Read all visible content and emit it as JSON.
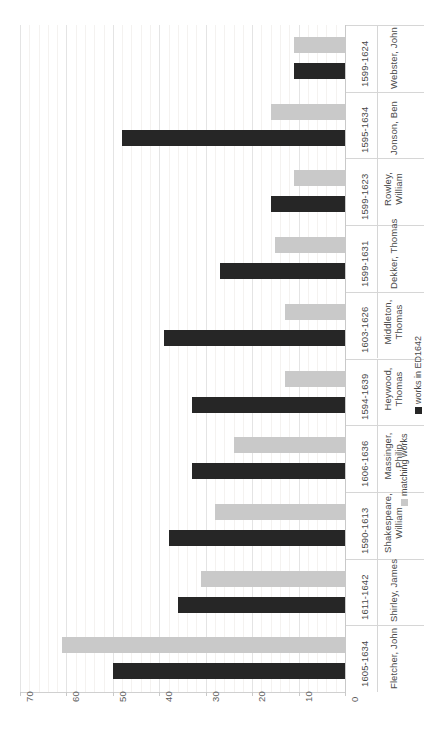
{
  "chart_data": {
    "type": "bar",
    "orientation": "horizontal",
    "title": "",
    "xlabel": "",
    "ylabel": "",
    "xlim": [
      0,
      70
    ],
    "x_axis_reversed": true,
    "grid": true,
    "legend_position": "right",
    "categories": [
      "Webster, John",
      "Jonson, Ben",
      "Rowley, William",
      "Dekker, Thomas",
      "Middleton, Thomas",
      "Heywood, Thomas",
      "Massinger, Philip",
      "Shakespeare, William",
      "Shirley, James",
      "Fletcher, John"
    ],
    "category_years": [
      "1599-1624",
      "1595-1634",
      "1599-1623",
      "1599-1631",
      "1603-1626",
      "1594-1639",
      "1606-1636",
      "1590-1613",
      "1611-1642",
      "1605-1634"
    ],
    "series": [
      {
        "name": "works in ED1642",
        "color": "#262626",
        "values": [
          11,
          48,
          16,
          27,
          39,
          33,
          33,
          38,
          36,
          50
        ]
      },
      {
        "name": "matching works",
        "color": "#c9c9c9",
        "values": [
          11,
          16,
          11,
          15,
          13,
          13,
          24,
          28,
          31,
          61
        ]
      }
    ],
    "tick_labels": [
      "70",
      "60",
      "50",
      "40",
      "30",
      "20",
      "10",
      "0"
    ],
    "tick_values": [
      70,
      60,
      50,
      40,
      30,
      20,
      10,
      0
    ]
  },
  "legend": {
    "items": [
      {
        "label": "works in ED1642",
        "swatch": "dark-square-icon"
      },
      {
        "label": "matching works",
        "swatch": "light-square-icon"
      }
    ]
  }
}
